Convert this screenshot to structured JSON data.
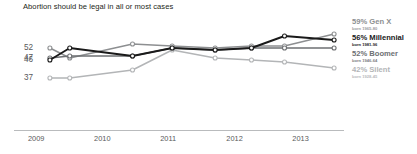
{
  "chart_data": {
    "type": "line",
    "title": "Abortion should be legal in all or most cases",
    "xlabel": "",
    "ylabel": "",
    "grid": false,
    "legend_position": "right",
    "xlim": [
      2009.0,
      2013.6
    ],
    "ylim": [
      33,
      62
    ],
    "xticks": [
      "2009",
      "2010",
      "2011",
      "2012",
      "2013"
    ],
    "xtick_values": [
      2009,
      2010,
      2011,
      2012,
      2013
    ],
    "yticks": [
      "52",
      "47",
      "46",
      "37"
    ],
    "ytick_values": [
      52,
      47,
      46,
      37
    ],
    "x": [
      2009.15,
      2009.45,
      2010.4,
      2011.0,
      2011.65,
      2012.2,
      2012.7,
      2013.45
    ],
    "series": [
      {
        "name": "Gen X",
        "label": "59% Gen X",
        "sublabel": "born 1965-80",
        "end_value": 59,
        "color": "#8d8f91",
        "values": [
          52,
          47,
          54,
          53,
          52,
          53,
          53,
          59
        ]
      },
      {
        "name": "Millennial",
        "label": "56% Millennial",
        "sublabel": "born 1981-96",
        "end_value": 56,
        "color": "#1a1a1a",
        "values": [
          46,
          52,
          48,
          52,
          51,
          52,
          58,
          56
        ]
      },
      {
        "name": "Boomer",
        "label": "52% Boomer",
        "sublabel": "born 1946-64",
        "end_value": 52,
        "color": "#6e7073",
        "values": [
          47,
          48,
          48,
          52,
          51,
          52,
          52,
          52
        ]
      },
      {
        "name": "Silent",
        "label": "42% Silent",
        "sublabel": "born 1928-45",
        "end_value": 42,
        "color": "#b3b5b7",
        "values": [
          37,
          37,
          41,
          51,
          47,
          46,
          45,
          42
        ]
      }
    ]
  }
}
